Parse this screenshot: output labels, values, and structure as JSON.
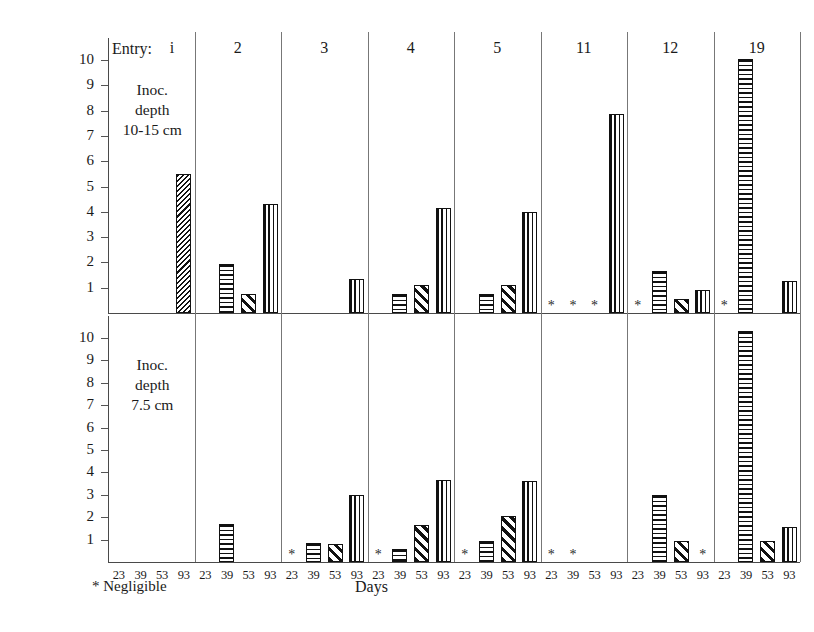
{
  "chart_data": {
    "type": "bar",
    "title": "",
    "xlabel": "Days",
    "ylabel": "Nodule wt (mg)",
    "ylim": [
      0,
      10.8
    ],
    "yticks": [
      1,
      2,
      3,
      4,
      5,
      6,
      7,
      8,
      9,
      10
    ],
    "grid": false,
    "legend_position": "none",
    "group_label_prefix": "Entry:",
    "categories": [
      "23",
      "39",
      "53",
      "93"
    ],
    "entries": [
      "i",
      "2",
      "3",
      "4",
      "5",
      "11",
      "12",
      "19"
    ],
    "negligible_marker": "*",
    "negligible_note": "*  Negligible",
    "panels": [
      {
        "name": "top",
        "note_lines": [
          "Inoc.",
          "depth",
          "10-15 cm"
        ],
        "series": [
          {
            "entry": "i",
            "values": [
              null,
              null,
              null,
              5.5
            ],
            "patterns": [
              null,
              null,
              null,
              "diagonal-fine"
            ],
            "negligible": [
              false,
              false,
              false,
              false
            ]
          },
          {
            "entry": "2",
            "values": [
              null,
              1.95,
              0.75,
              4.3
            ],
            "patterns": [
              null,
              "horizontal",
              "diagonal",
              "vertical"
            ],
            "negligible": [
              false,
              false,
              false,
              false
            ]
          },
          {
            "entry": "3",
            "values": [
              null,
              null,
              null,
              1.35
            ],
            "patterns": [
              null,
              null,
              null,
              "vertical"
            ],
            "negligible": [
              false,
              false,
              false,
              false
            ]
          },
          {
            "entry": "4",
            "values": [
              null,
              0.75,
              1.1,
              4.15
            ],
            "patterns": [
              null,
              "horizontal",
              "diagonal",
              "vertical"
            ],
            "negligible": [
              false,
              false,
              false,
              false
            ]
          },
          {
            "entry": "5",
            "values": [
              null,
              0.75,
              1.1,
              4.0
            ],
            "patterns": [
              null,
              "horizontal",
              "diagonal",
              "vertical"
            ],
            "negligible": [
              false,
              false,
              false,
              false
            ]
          },
          {
            "entry": "11",
            "values": [
              null,
              null,
              null,
              7.85
            ],
            "patterns": [
              null,
              null,
              null,
              "vertical"
            ],
            "negligible": [
              true,
              true,
              true,
              false
            ]
          },
          {
            "entry": "12",
            "values": [
              null,
              1.65,
              0.55,
              0.9
            ],
            "patterns": [
              null,
              "horizontal",
              "diagonal",
              "vertical"
            ],
            "negligible": [
              true,
              false,
              false,
              false
            ]
          },
          {
            "entry": "19",
            "values": [
              null,
              10.05,
              null,
              1.25
            ],
            "patterns": [
              null,
              "horizontal",
              null,
              "vertical"
            ],
            "negligible": [
              true,
              false,
              false,
              false
            ]
          }
        ]
      },
      {
        "name": "bottom",
        "note_lines": [
          "Inoc.",
          "depth",
          "7.5  cm"
        ],
        "series": [
          {
            "entry": "i",
            "values": [
              null,
              null,
              null,
              null
            ],
            "patterns": [
              null,
              null,
              null,
              null
            ],
            "negligible": [
              false,
              false,
              false,
              false
            ]
          },
          {
            "entry": "2",
            "values": [
              null,
              1.7,
              null,
              null
            ],
            "patterns": [
              null,
              "horizontal",
              null,
              null
            ],
            "negligible": [
              false,
              false,
              false,
              false
            ]
          },
          {
            "entry": "3",
            "values": [
              null,
              0.85,
              0.8,
              3.0
            ],
            "patterns": [
              null,
              "horizontal",
              "diagonal",
              "vertical"
            ],
            "negligible": [
              true,
              false,
              false,
              false
            ]
          },
          {
            "entry": "4",
            "values": [
              null,
              0.6,
              1.65,
              3.65
            ],
            "patterns": [
              null,
              "horizontal",
              "diagonal",
              "vertical"
            ],
            "negligible": [
              true,
              false,
              false,
              false
            ]
          },
          {
            "entry": "5",
            "values": [
              null,
              0.95,
              2.05,
              3.6
            ],
            "patterns": [
              null,
              "horizontal",
              "diagonal",
              "vertical"
            ],
            "negligible": [
              true,
              false,
              false,
              false
            ]
          },
          {
            "entry": "11",
            "values": [
              null,
              null,
              null,
              null
            ],
            "patterns": [
              null,
              null,
              null,
              null
            ],
            "negligible": [
              true,
              true,
              false,
              false
            ]
          },
          {
            "entry": "12",
            "values": [
              null,
              3.0,
              0.95,
              null
            ],
            "patterns": [
              null,
              "horizontal",
              "diagonal",
              null
            ],
            "negligible": [
              false,
              false,
              false,
              true
            ]
          },
          {
            "entry": "19",
            "values": [
              null,
              10.3,
              0.95,
              1.55
            ],
            "patterns": [
              null,
              "horizontal",
              "diagonal",
              "vertical"
            ],
            "negligible": [
              false,
              false,
              false,
              false
            ]
          }
        ]
      }
    ]
  },
  "axes": {
    "y_title": "Nodule wt (mg)",
    "x_title": "Days"
  },
  "footnote": {
    "marker": "*",
    "text": "Negligible"
  }
}
